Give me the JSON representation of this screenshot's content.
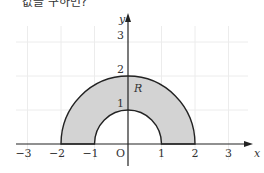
{
  "header": {
    "text": "값을 구하면?"
  },
  "figure": {
    "x_axis_label": "x",
    "y_axis_label": "y",
    "origin_label": "O",
    "region_label": "R",
    "x_ticks": [
      "−3",
      "−2",
      "−1",
      "1",
      "2",
      "3"
    ],
    "x_tick_values": [
      -3,
      -2,
      -1,
      1,
      2,
      3
    ],
    "y_ticks": [
      "1",
      "2",
      "3"
    ],
    "y_tick_values": [
      1,
      2,
      3
    ],
    "inner_radius": 1,
    "outer_radius": 2,
    "fill_color": "#d3d3d3",
    "stroke_color": "#222222",
    "grid_color": "#ececec"
  }
}
